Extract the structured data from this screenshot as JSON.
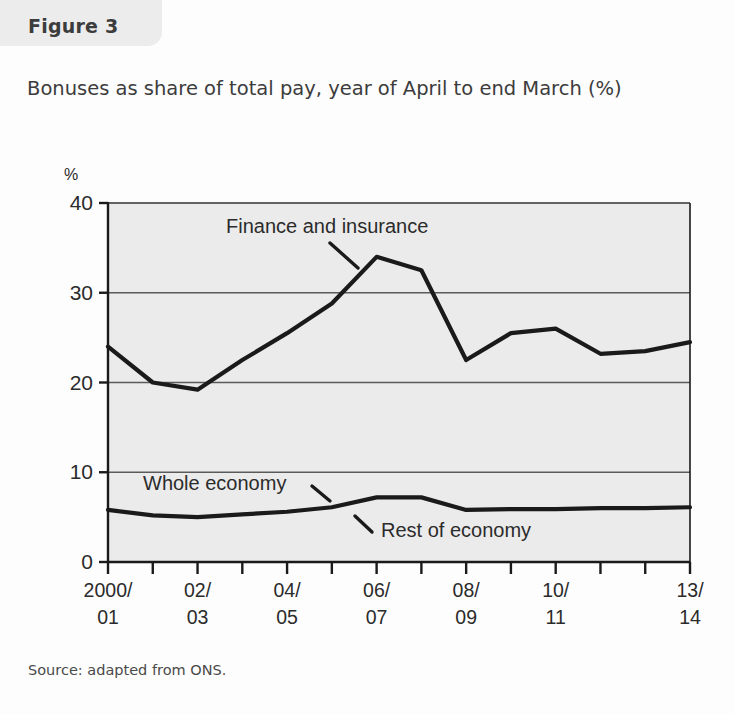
{
  "figure": {
    "label": "Figure 3",
    "title": "Bonuses as share of total pay, year of April to end March (%)",
    "source": "Source: adapted from ONS."
  },
  "chart_data": {
    "type": "line",
    "title": "Bonuses as share of total pay, year of April to end March (%)",
    "xlabel": "",
    "ylabel": "%",
    "yunit": "%",
    "ylim": [
      0,
      40
    ],
    "yticks": [
      0,
      10,
      20,
      30,
      40
    ],
    "ytick_labels": [
      "0",
      "10",
      "20",
      "30",
      "40"
    ],
    "grid": true,
    "legend_position": "inline-annotations",
    "x": [
      "2000/01",
      "2001/02",
      "2002/03",
      "2003/04",
      "2004/05",
      "2005/06",
      "2006/07",
      "2007/08",
      "2008/09",
      "2009/10",
      "2010/11",
      "2011/12",
      "2012/13",
      "2013/14"
    ],
    "xtick_labels": [
      "2000/\n01",
      "",
      "02/\n03",
      "",
      "04/\n05",
      "",
      "06/\n07",
      "",
      "08/\n09",
      "",
      "10/\n11",
      "",
      "",
      "13/\n14"
    ],
    "xtick_labels_visible": [
      {
        "index": 0,
        "line1": "2000/",
        "line2": "01"
      },
      {
        "index": 2,
        "line1": "02/",
        "line2": "03"
      },
      {
        "index": 4,
        "line1": "04/",
        "line2": "05"
      },
      {
        "index": 6,
        "line1": "06/",
        "line2": "07"
      },
      {
        "index": 8,
        "line1": "08/",
        "line2": "09"
      },
      {
        "index": 10,
        "line1": "10/",
        "line2": "11"
      },
      {
        "index": 13,
        "line1": "13/",
        "line2": "14"
      }
    ],
    "series": [
      {
        "name": "Finance and insurance",
        "values": [
          24.0,
          20.0,
          19.2,
          22.5,
          25.5,
          28.8,
          34.0,
          32.5,
          22.5,
          25.5,
          26.0,
          23.2,
          23.5,
          24.5
        ]
      },
      {
        "name": "Whole economy",
        "values": [
          5.8,
          5.2,
          5.0,
          5.3,
          5.6,
          6.1,
          7.2,
          7.2,
          5.8,
          5.9,
          5.9,
          6.0,
          6.0,
          6.1
        ]
      }
    ],
    "annotations": [
      {
        "text": "Finance and insurance",
        "target_series": "Finance and insurance"
      },
      {
        "text": "Whole economy",
        "target_series": "Whole economy"
      },
      {
        "text": "Rest of economy",
        "target_series": "Rest of economy"
      }
    ],
    "colors": {
      "line": "#1a1a1a",
      "plot_background": "#ebebeb",
      "gridline": "#5a5a5a",
      "axis": "#1a1a1a",
      "text": "#2b2b2b"
    }
  }
}
